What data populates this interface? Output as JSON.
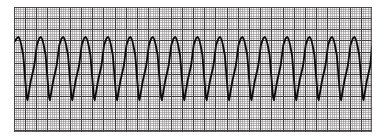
{
  "page": {
    "background_color": "#ffffff",
    "width": 389,
    "height": 139
  },
  "strip": {
    "name": "ecg-rhythm-strip",
    "x": 14,
    "y": 7,
    "width": 358,
    "height": 125,
    "paper_color": "#f2f0f0",
    "fine_grid_color": "#8d8a8a",
    "bold_grid_color": "#3a3838",
    "fine_grid_spacing": 2.24,
    "bold_grid_every": 5,
    "fine_grid_width": 0.55,
    "bold_grid_width": 0.95,
    "border_color": "#4a4848",
    "border_width": 0.8
  },
  "trace": {
    "name": "ecg-waveform-trace",
    "color": "#0d0d0d",
    "line_width": 1.85,
    "baseline_y": 72,
    "peak_y": 37,
    "trough_y": 100,
    "period_px": 22.4,
    "first_peak_x": 18.5,
    "complex_count": 16,
    "morphology": "wide-complex monomorphic tachycardia: sharp upstroke to R peak, slow convex downslope, steep near-vertical descent to narrow deep S trough, fast rise to next R peak"
  },
  "chart_data": {
    "type": "line",
    "subtitle": "Wide-complex monomorphic tachycardia",
    "xlabel": "Time",
    "ylabel": "Amplitude",
    "grid": true,
    "legend": false,
    "xlim": [
      0,
      358
    ],
    "ylim": [
      125,
      0
    ],
    "axis_units": {
      "x": "1 small box = 0.04 s, 1 large box = 0.20 s",
      "y": "1 small box = 0.1 mV, 1 large box = 0.5 mV"
    },
    "beat_count": 16,
    "beat_period_px": 22.4,
    "beats": [
      {
        "index": 1,
        "peak_x": 18.5,
        "peak_y": 37,
        "trough_x": 27.5,
        "trough_y": 100
      },
      {
        "index": 2,
        "peak_x": 40.9,
        "peak_y": 37,
        "trough_x": 49.9,
        "trough_y": 100
      },
      {
        "index": 3,
        "peak_x": 63.3,
        "peak_y": 37,
        "trough_x": 72.3,
        "trough_y": 100
      },
      {
        "index": 4,
        "peak_x": 85.7,
        "peak_y": 37,
        "trough_x": 94.7,
        "trough_y": 100
      },
      {
        "index": 5,
        "peak_x": 108.1,
        "peak_y": 37,
        "trough_x": 117.1,
        "trough_y": 100
      },
      {
        "index": 6,
        "peak_x": 130.5,
        "peak_y": 37,
        "trough_x": 139.5,
        "trough_y": 100
      },
      {
        "index": 7,
        "peak_x": 152.9,
        "peak_y": 37,
        "trough_x": 161.9,
        "trough_y": 100
      },
      {
        "index": 8,
        "peak_x": 175.3,
        "peak_y": 37,
        "trough_x": 184.3,
        "trough_y": 100
      },
      {
        "index": 9,
        "peak_x": 197.7,
        "peak_y": 37,
        "trough_x": 206.7,
        "trough_y": 100
      },
      {
        "index": 10,
        "peak_x": 220.1,
        "peak_y": 37,
        "trough_x": 229.1,
        "trough_y": 100
      },
      {
        "index": 11,
        "peak_x": 242.5,
        "peak_y": 37,
        "trough_x": 251.5,
        "trough_y": 100
      },
      {
        "index": 12,
        "peak_x": 264.9,
        "peak_y": 37,
        "trough_x": 273.9,
        "trough_y": 100
      },
      {
        "index": 13,
        "peak_x": 287.3,
        "peak_y": 37,
        "trough_x": 296.3,
        "trough_y": 100
      },
      {
        "index": 14,
        "peak_x": 309.7,
        "peak_y": 37,
        "trough_x": 318.7,
        "trough_y": 100
      },
      {
        "index": 15,
        "peak_x": 332.1,
        "peak_y": 37,
        "trough_x": 341.1,
        "trough_y": 100
      },
      {
        "index": 16,
        "peak_x": 354.5,
        "peak_y": 37,
        "trough_x": 363.5,
        "trough_y": 100
      }
    ]
  }
}
